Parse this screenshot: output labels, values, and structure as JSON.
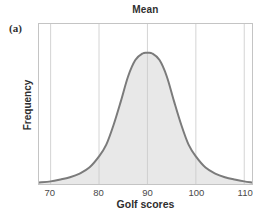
{
  "panel_label": "(a)",
  "chart_data": {
    "type": "area",
    "title": "Mean",
    "xlabel": "Golf scores",
    "ylabel": "Frequency",
    "x_ticks": [
      70,
      80,
      90,
      100,
      110
    ],
    "x_range": [
      67.6,
      111.6
    ],
    "y_range": [
      0,
      1.22
    ],
    "grid": "vertical-gridlines-at-each-x-tick",
    "legend": "none",
    "mean": 90,
    "peak_relative_height": 1.0,
    "curve_points": [
      [
        67.6,
        0.012
      ],
      [
        70,
        0.02
      ],
      [
        72,
        0.034
      ],
      [
        74,
        0.052
      ],
      [
        76,
        0.08
      ],
      [
        78,
        0.125
      ],
      [
        80,
        0.21
      ],
      [
        81.5,
        0.3
      ],
      [
        83,
        0.45
      ],
      [
        84.5,
        0.63
      ],
      [
        86,
        0.82
      ],
      [
        87.5,
        0.945
      ],
      [
        89,
        0.995
      ],
      [
        90,
        1.0
      ],
      [
        91,
        0.995
      ],
      [
        92.5,
        0.945
      ],
      [
        94,
        0.82
      ],
      [
        95.5,
        0.63
      ],
      [
        97,
        0.45
      ],
      [
        98.5,
        0.3
      ],
      [
        100,
        0.21
      ],
      [
        102,
        0.125
      ],
      [
        104,
        0.08
      ],
      [
        106,
        0.052
      ],
      [
        108,
        0.034
      ],
      [
        110,
        0.02
      ],
      [
        111.6,
        0.012
      ]
    ]
  },
  "colors": {
    "curve_stroke": "#7b7b7b",
    "curve_fill": "#e8e8e8",
    "gridline": "#c9c9c9",
    "plot_border": "#c4c4c4",
    "text": "#2f2f2f",
    "tick_text": "#4a4a4a"
  }
}
